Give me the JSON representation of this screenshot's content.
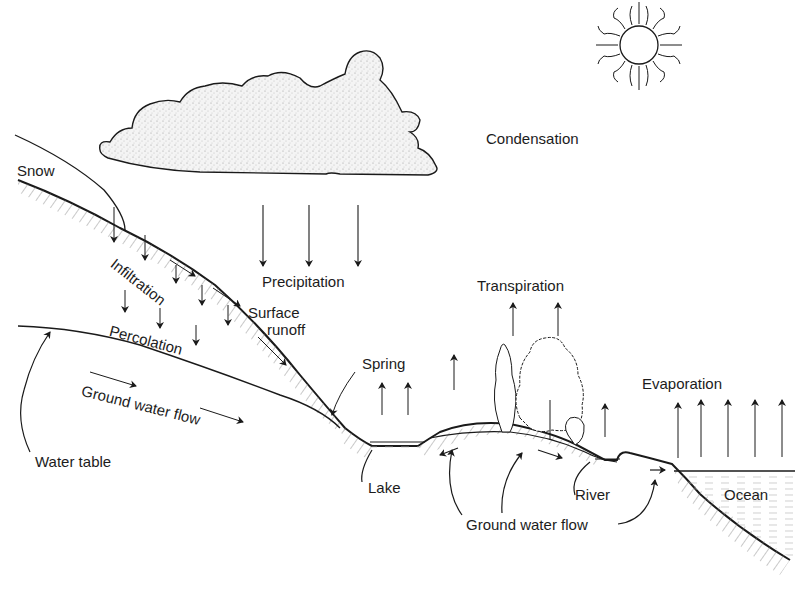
{
  "diagram": {
    "type": "hydrologic-cycle",
    "labels": {
      "condensation": "Condensation",
      "snow": "Snow",
      "precipitation": "Precipitation",
      "infiltration": "Infiltration",
      "surface_runoff_1": "Surface",
      "surface_runoff_2": "runoff",
      "percolation": "Percolation",
      "ground_water_flow_upper": "Ground  water flow",
      "water_table": "Water table",
      "transpiration": "Transpiration",
      "spring": "Spring",
      "evaporation": "Evaporation",
      "lake": "Lake",
      "river": "River",
      "ocean": "Ocean",
      "ground_water_flow_lower": "Ground  water flow"
    },
    "icons": [
      "sun-icon",
      "cloud-icon",
      "tree-icon",
      "arrow-icon"
    ],
    "colors": {
      "ink": "#1a1a1a",
      "background": "#ffffff",
      "cloud_fill": "#efefef",
      "water_hatch": "#9a9a9a"
    }
  }
}
